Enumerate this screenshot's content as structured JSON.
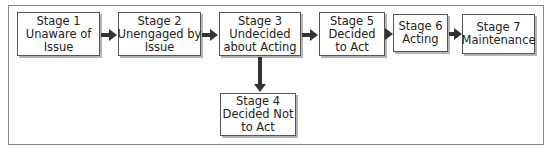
{
  "diagram": {
    "type": "flowchart",
    "stages": [
      {
        "id": "stage1",
        "title": "Stage 1",
        "lines": [
          "Unaware of",
          "Issue"
        ]
      },
      {
        "id": "stage2",
        "title": "Stage 2",
        "lines": [
          "Unengaged by",
          "Issue"
        ]
      },
      {
        "id": "stage3",
        "title": "Stage 3",
        "lines": [
          "Undecided",
          "about Acting"
        ]
      },
      {
        "id": "stage4",
        "title": "Stage 4",
        "lines": [
          "Decided Not",
          "to Act"
        ]
      },
      {
        "id": "stage5",
        "title": "Stage 5",
        "lines": [
          "Decided",
          "to Act"
        ]
      },
      {
        "id": "stage6",
        "title": "Stage 6",
        "lines": [
          "Acting"
        ]
      },
      {
        "id": "stage7",
        "title": "Stage 7",
        "lines": [
          "Maintenance"
        ]
      }
    ],
    "edges": [
      {
        "from": "stage1",
        "to": "stage2"
      },
      {
        "from": "stage2",
        "to": "stage3"
      },
      {
        "from": "stage3",
        "to": "stage5"
      },
      {
        "from": "stage3",
        "to": "stage4"
      },
      {
        "from": "stage5",
        "to": "stage6"
      },
      {
        "from": "stage6",
        "to": "stage7"
      }
    ]
  }
}
